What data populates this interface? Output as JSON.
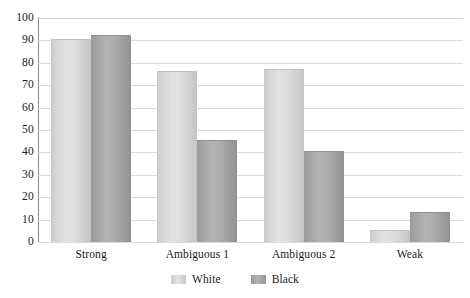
{
  "chart_data": {
    "type": "bar",
    "title": "",
    "subtitle": "",
    "xlabel": "",
    "ylabel": "",
    "categories": [
      "Strong",
      "Ambiguous 1",
      "Ambiguous 2",
      "Weak"
    ],
    "series": [
      {
        "name": "White",
        "color": "#dcdcdc",
        "values": [
          90,
          76,
          77,
          5
        ]
      },
      {
        "name": "Black",
        "color": "#a8a8a8",
        "values": [
          92,
          45,
          40,
          13
        ]
      }
    ],
    "ylim": [
      0,
      100
    ],
    "ytick_step": 10,
    "yticks": [
      "0",
      "10",
      "20",
      "30",
      "40",
      "50",
      "60",
      "70",
      "80",
      "90",
      "100"
    ],
    "grid": true,
    "grid_axis": "y",
    "legend_position": "bottom-center",
    "annotations": []
  },
  "legend": {
    "items": [
      {
        "label": "White",
        "swatch": "legend-swatch-white"
      },
      {
        "label": "Black",
        "swatch": "legend-swatch-black"
      }
    ]
  },
  "colors": {
    "series_white": "#dcdcdc",
    "series_black": "#a8a8a8",
    "gridline": "#d9d9d9",
    "axis": "#8a8a8a",
    "text": "#1a1a1a",
    "background": "#ffffff"
  }
}
